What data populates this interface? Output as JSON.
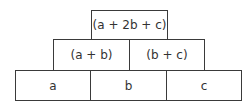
{
  "pyramid": {
    "rows": [
      {
        "bricks": [
          {
            "label": "(a + 2b + c)"
          }
        ]
      },
      {
        "bricks": [
          {
            "label": "(a + b)"
          },
          {
            "label": "(b + c)"
          }
        ]
      },
      {
        "bricks": [
          {
            "label": "a"
          },
          {
            "label": "b"
          },
          {
            "label": "c"
          }
        ]
      }
    ]
  }
}
